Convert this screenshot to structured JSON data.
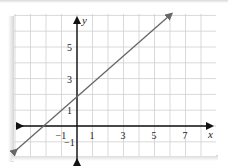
{
  "chart_data": {
    "type": "line",
    "title": "",
    "xlabel": "x",
    "ylabel": "y",
    "xlim": [
      -4,
      9
    ],
    "ylim": [
      -2,
      7
    ],
    "grid": true,
    "x_ticks": [
      "-1",
      "1",
      "3",
      "5",
      "7"
    ],
    "y_ticks": [
      "-1",
      "1",
      "3",
      "5"
    ],
    "series": [
      {
        "name": "line",
        "type": "line",
        "y_intercept": 2,
        "x_intercept": -2.4,
        "points": [
          {
            "x": -3.9,
            "y": -1.5
          },
          {
            "x": 6.1,
            "y": 7.1
          }
        ],
        "arrows": "both",
        "color": "#666666"
      }
    ]
  },
  "colors": {
    "grid": "#cfcfcf",
    "axis": "#111111",
    "line": "#666666"
  }
}
